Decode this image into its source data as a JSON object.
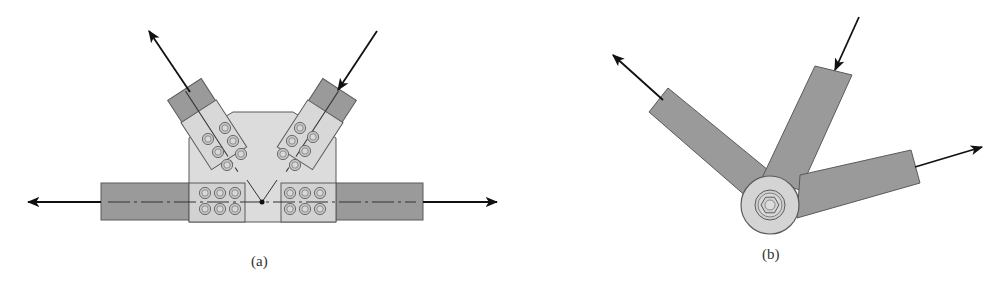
{
  "figure": {
    "panel_a": {
      "label": "(a)",
      "description": "Bolted gusset plate truss joint with two diagonal members and a horizontal chord",
      "members": [
        "horizontal-chord-left",
        "horizontal-chord-right",
        "diagonal-left",
        "diagonal-right"
      ],
      "forces": [
        {
          "member": "diagonal-left",
          "direction": "up-left",
          "sense": "tension"
        },
        {
          "member": "diagonal-right",
          "direction": "down-left",
          "sense": "compression"
        },
        {
          "member": "chord-left",
          "direction": "left",
          "sense": "tension"
        },
        {
          "member": "chord-right",
          "direction": "right",
          "sense": "tension"
        }
      ],
      "bolt_groups": [
        {
          "name": "diagonal-left-bolts",
          "count": 7
        },
        {
          "name": "diagonal-right-bolts",
          "count": 7
        },
        {
          "name": "chord-left-bolts",
          "count": 6
        },
        {
          "name": "chord-right-bolts",
          "count": 6
        }
      ]
    },
    "panel_b": {
      "label": "(b)",
      "description": "Idealized pin-connected joint with three members meeting at a single pin",
      "forces": [
        {
          "member": "left-member",
          "direction": "up-left",
          "sense": "tension"
        },
        {
          "member": "middle-member",
          "direction": "down-left",
          "sense": "compression"
        },
        {
          "member": "right-member",
          "direction": "right",
          "sense": "tension"
        }
      ]
    },
    "colors": {
      "member_fill": "#9a9a9a",
      "plate_fill": "#dcdcdc",
      "splice_fill": "#d2d2d2",
      "outline": "#5a5a5a",
      "arrow": "#111111",
      "pin_fill": "#d4d4d4"
    }
  }
}
